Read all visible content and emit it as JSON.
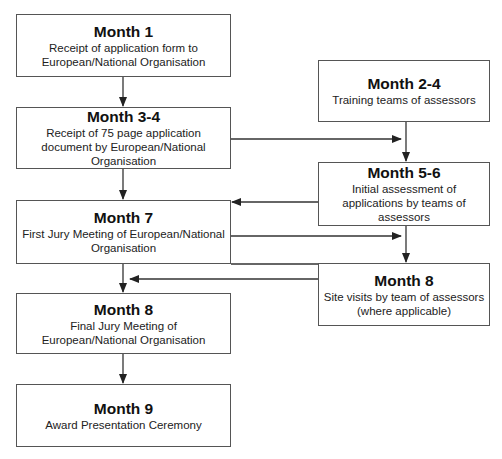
{
  "boxes": {
    "m1": {
      "title": "Month 1",
      "lines": [
        "Receipt of application form to",
        "European/National Organisation"
      ]
    },
    "m34": {
      "title": "Month 3-4",
      "lines": [
        "Receipt of 75 page application",
        "document by European/National",
        "Organisation"
      ]
    },
    "m7": {
      "title": "Month 7",
      "lines": [
        "First Jury Meeting of European/National",
        "Organisation"
      ]
    },
    "m8l": {
      "title": "Month 8",
      "lines": [
        "Final Jury Meeting of",
        "European/National Organisation"
      ]
    },
    "m9": {
      "title": "Month 9",
      "lines": [
        "Award Presentation Ceremony"
      ]
    },
    "m24": {
      "title": "Month 2-4",
      "lines": [
        "Training teams of assessors"
      ]
    },
    "m56": {
      "title": "Month 5-6",
      "lines": [
        "Initial assessment of",
        "applications by teams of",
        "assessors"
      ]
    },
    "m8r": {
      "title": "Month 8",
      "lines": [
        "Site visits by team of assessors",
        "(where applicable)"
      ]
    }
  },
  "colors": {
    "line": "#333333",
    "border": "#555555",
    "text": "#111111"
  }
}
